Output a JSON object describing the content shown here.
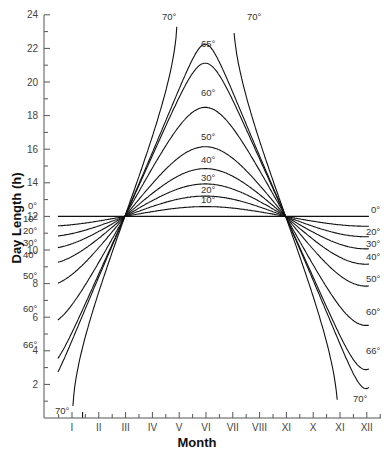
{
  "chart_data": {
    "type": "line",
    "title": "",
    "xlabel": "Month",
    "ylabel": "Day Length (h)",
    "ylim": [
      0,
      24
    ],
    "yticks": [
      2,
      4,
      6,
      8,
      10,
      12,
      14,
      16,
      18,
      20,
      22,
      24
    ],
    "categories": [
      "I",
      "II",
      "III",
      "IV",
      "V",
      "VI",
      "VII",
      "VIII",
      "XI",
      "X",
      "XI",
      "XII"
    ],
    "grid": false,
    "legend": "inline curve labels (latitude)",
    "series": [
      {
        "name": "0°",
        "values": [
          12,
          12,
          12,
          12,
          12,
          12,
          12,
          12,
          12,
          12,
          12,
          12
        ]
      },
      {
        "name": "10°",
        "values": [
          11.5,
          11.7,
          12,
          12.3,
          12.5,
          12.6,
          12.5,
          12.3,
          12,
          11.7,
          11.5,
          11.4
        ]
      },
      {
        "name": "20°",
        "values": [
          11.0,
          11.4,
          12,
          12.6,
          13.0,
          13.2,
          13.0,
          12.6,
          12,
          11.4,
          11.0,
          10.8
        ]
      },
      {
        "name": "30°",
        "values": [
          10.5,
          11.1,
          12,
          12.9,
          13.6,
          13.9,
          13.6,
          12.9,
          12,
          11.1,
          10.5,
          10.2
        ]
      },
      {
        "name": "40°",
        "values": [
          9.8,
          10.7,
          12,
          13.4,
          14.4,
          14.8,
          14.4,
          13.4,
          12,
          10.6,
          9.8,
          9.3
        ]
      },
      {
        "name": "50°",
        "values": [
          8.8,
          10.1,
          12,
          13.9,
          15.5,
          16.3,
          15.5,
          13.9,
          12,
          10.1,
          8.8,
          7.9
        ]
      },
      {
        "name": "60°",
        "values": [
          7.1,
          9.3,
          12,
          14.8,
          17.6,
          18.8,
          17.6,
          14.8,
          12,
          9.3,
          7.1,
          5.6
        ]
      },
      {
        "name": "65°",
        "values": [
          5.4,
          8.6,
          12,
          15.6,
          19.8,
          21.8,
          19.8,
          15.6,
          12,
          8.6,
          5.4,
          3.6
        ]
      },
      {
        "name": "66°",
        "values": [
          4.8,
          8.4,
          12,
          15.8,
          20.5,
          23,
          20.5,
          15.8,
          12,
          8.4,
          4.8,
          2.8
        ]
      },
      {
        "name": "70°",
        "values": [
          0,
          7.2,
          12,
          17.2,
          24,
          24,
          24,
          17.2,
          12,
          7.2,
          0,
          0
        ]
      }
    ],
    "latitudes": [
      0,
      10,
      20,
      30,
      40,
      50,
      60,
      65,
      66,
      70
    ],
    "annotations": {
      "left": [
        {
          "text": "0°",
          "x": 28,
          "y": 209
        },
        {
          "text": "10°",
          "x": 23,
          "y": 222
        },
        {
          "text": "20°",
          "x": 23,
          "y": 234
        },
        {
          "text": "30°",
          "x": 23,
          "y": 246
        },
        {
          "text": "40°",
          "x": 23,
          "y": 258
        },
        {
          "text": "50°",
          "x": 23,
          "y": 279
        },
        {
          "text": "60°",
          "x": 23,
          "y": 312
        },
        {
          "text": "66°",
          "x": 23,
          "y": 348
        },
        {
          "text": "70°",
          "x": 55,
          "y": 414
        }
      ],
      "right": [
        {
          "text": "0°",
          "x": 371,
          "y": 213
        },
        {
          "text": "20°",
          "x": 366,
          "y": 235
        },
        {
          "text": "30°",
          "x": 366,
          "y": 247
        },
        {
          "text": "40°",
          "x": 366,
          "y": 260
        },
        {
          "text": "50°",
          "x": 366,
          "y": 282
        },
        {
          "text": "60°",
          "x": 366,
          "y": 315
        },
        {
          "text": "66°",
          "x": 366,
          "y": 354
        },
        {
          "text": "70°",
          "x": 353,
          "y": 402
        }
      ],
      "top": [
        {
          "text": "70°",
          "x": 162,
          "y": 20
        },
        {
          "text": "70°",
          "x": 247,
          "y": 20
        },
        {
          "text": "65°",
          "x": 201,
          "y": 47
        },
        {
          "text": "60°",
          "x": 201,
          "y": 96
        },
        {
          "text": "50°",
          "x": 201,
          "y": 140
        },
        {
          "text": "40°",
          "x": 201,
          "y": 163
        },
        {
          "text": "30°",
          "x": 201,
          "y": 181
        },
        {
          "text": "20°",
          "x": 201,
          "y": 193
        },
        {
          "text": "10°",
          "x": 201,
          "y": 203
        }
      ]
    }
  }
}
